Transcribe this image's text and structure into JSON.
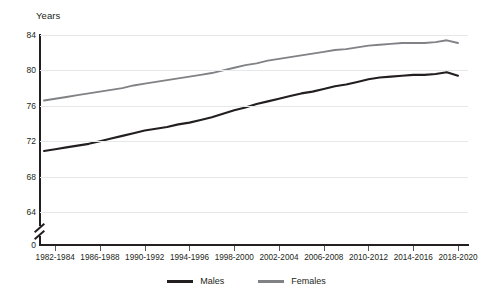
{
  "page": {
    "title_strip": "",
    "y_axis_title": "Years"
  },
  "legend": {
    "items": [
      {
        "label": "Males",
        "color": "#231f20"
      },
      {
        "label": "Females",
        "color": "#808285"
      }
    ]
  },
  "axes": {
    "y_ticks": [
      "84",
      "80",
      "76",
      "72",
      "68",
      "64",
      "0"
    ],
    "x_ticks": [
      "1982-1984",
      "1986-1988",
      "1990-1992",
      "1994-1996",
      "1998-2000",
      "2002-2004",
      "2006-2008",
      "2010-2012",
      "2014-2016",
      "2018-2020"
    ]
  },
  "chart_data": {
    "type": "line",
    "title": "",
    "xlabel": "",
    "ylabel": "Years",
    "ylim": [
      64,
      84
    ],
    "y_break": true,
    "y_break_from": 0,
    "grid": true,
    "legend_position": "bottom",
    "x": [
      "1981-1983",
      "1982-1984",
      "1983-1985",
      "1984-1986",
      "1985-1987",
      "1986-1988",
      "1987-1989",
      "1988-1990",
      "1989-1991",
      "1990-1992",
      "1991-1993",
      "1992-1994",
      "1993-1995",
      "1994-1996",
      "1995-1997",
      "1996-1998",
      "1997-1999",
      "1998-2000",
      "1999-2001",
      "2000-2002",
      "2001-2003",
      "2002-2004",
      "2003-2005",
      "2004-2006",
      "2005-2007",
      "2006-2008",
      "2007-2009",
      "2008-2010",
      "2009-2011",
      "2010-2012",
      "2011-2013",
      "2012-2014",
      "2013-2015",
      "2014-2016",
      "2015-2017",
      "2016-2018",
      "2017-2019",
      "2018-2020"
    ],
    "series": [
      {
        "name": "Males",
        "color": "#231f20",
        "values": [
          70.9,
          71.1,
          71.3,
          71.5,
          71.7,
          72.0,
          72.3,
          72.6,
          72.9,
          73.2,
          73.4,
          73.6,
          73.9,
          74.1,
          74.4,
          74.7,
          75.1,
          75.5,
          75.8,
          76.2,
          76.5,
          76.8,
          77.1,
          77.4,
          77.6,
          77.9,
          78.2,
          78.4,
          78.7,
          79.0,
          79.2,
          79.3,
          79.4,
          79.5,
          79.5,
          79.6,
          79.8,
          79.4
        ]
      },
      {
        "name": "Females",
        "color": "#808285",
        "values": [
          76.6,
          76.8,
          77.0,
          77.2,
          77.4,
          77.6,
          77.8,
          78.0,
          78.3,
          78.5,
          78.7,
          78.9,
          79.1,
          79.3,
          79.5,
          79.7,
          80.0,
          80.3,
          80.6,
          80.8,
          81.1,
          81.3,
          81.5,
          81.7,
          81.9,
          82.1,
          82.3,
          82.4,
          82.6,
          82.8,
          82.9,
          83.0,
          83.1,
          83.1,
          83.1,
          83.2,
          83.4,
          83.1
        ]
      }
    ]
  }
}
